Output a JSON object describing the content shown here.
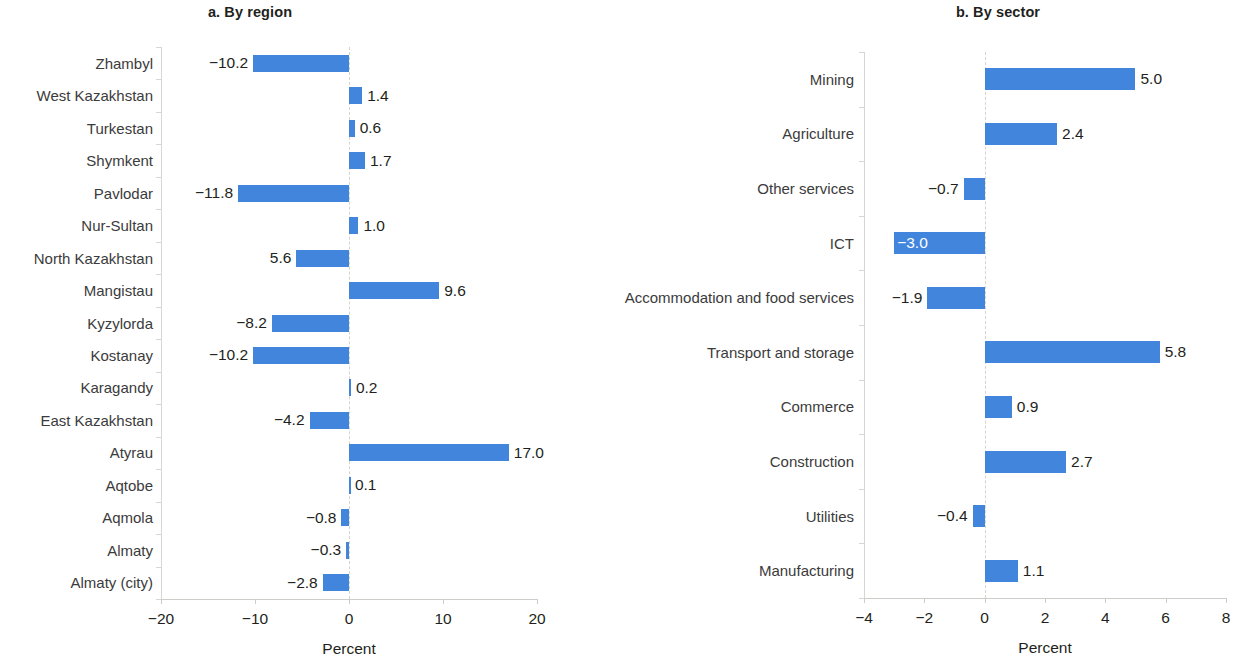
{
  "colors": {
    "bar": "#4285dc",
    "text": "#231f20",
    "axis": "#d8d6d4",
    "zero_line": "#d9d2c8",
    "inner_label": "#ffffff"
  },
  "chart_data": [
    {
      "type": "bar",
      "orientation": "horizontal",
      "panel": "a",
      "title": "a. By region",
      "xlabel": "Percent",
      "ylabel": "",
      "xlim": [
        -20,
        20
      ],
      "xticks": [
        -20,
        -10,
        0,
        10,
        20
      ],
      "xticklabels": [
        "−20",
        "−10",
        "0",
        "10",
        "20"
      ],
      "grid": false,
      "legend": null,
      "categories": [
        "Zhambyl",
        "West Kazakhstan",
        "Turkestan",
        "Shymkent",
        "Pavlodar",
        "Nur-Sultan",
        "North Kazakhstan",
        "Mangistau",
        "Kyzylorda",
        "Kostanay",
        "Karagandy",
        "East Kazakhstan",
        "Atyrau",
        "Aqtobe",
        "Aqmola",
        "Almaty",
        "Almaty (city)"
      ],
      "values": [
        -10.2,
        1.4,
        0.6,
        1.7,
        -11.8,
        1.0,
        -5.6,
        9.6,
        -8.2,
        -10.2,
        0.2,
        -4.2,
        17.0,
        0.1,
        -0.8,
        -0.3,
        -2.8
      ],
      "data_labels": [
        "−10.2",
        "1.4",
        "0.6",
        "1.7",
        "−11.8",
        "1.0",
        "5.6",
        "9.6",
        "−8.2",
        "−10.2",
        "0.2",
        "−4.2",
        "17.0",
        "0.1",
        "−0.8",
        "−0.3",
        "−2.8"
      ],
      "label_inside": [
        false,
        false,
        false,
        false,
        false,
        false,
        false,
        false,
        false,
        false,
        false,
        false,
        false,
        false,
        false,
        false,
        false
      ]
    },
    {
      "type": "bar",
      "orientation": "horizontal",
      "panel": "b",
      "title": "b. By sector",
      "xlabel": "Percent",
      "ylabel": "",
      "xlim": [
        -4,
        8
      ],
      "xticks": [
        -4,
        -2,
        0,
        2,
        4,
        6,
        8
      ],
      "xticklabels": [
        "−4",
        "−2",
        "0",
        "2",
        "4",
        "6",
        "8"
      ],
      "grid": false,
      "legend": null,
      "categories": [
        "Mining",
        "Agriculture",
        "Other services",
        "ICT",
        "Accommodation and food services",
        "Transport and storage",
        "Commerce",
        "Construction",
        "Utilities",
        "Manufacturing"
      ],
      "values": [
        5.0,
        2.4,
        -0.7,
        -3.0,
        -1.9,
        5.8,
        0.9,
        2.7,
        -0.4,
        1.1
      ],
      "data_labels": [
        "5.0",
        "2.4",
        "−0.7",
        "−3.0",
        "−1.9",
        "5.8",
        "0.9",
        "2.7",
        "−0.4",
        "1.1"
      ],
      "label_inside": [
        false,
        false,
        false,
        true,
        false,
        false,
        false,
        false,
        false,
        false
      ]
    }
  ]
}
